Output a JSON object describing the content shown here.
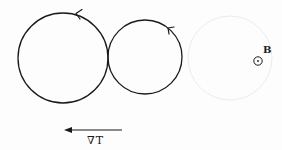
{
  "diagram": {
    "type": "physics-field-diagram",
    "colors": {
      "stroke": "#1a1a1a",
      "ghost": "#eeeeee",
      "background": "#fdfdfd"
    },
    "orbits": [
      {
        "id": "large",
        "cx": 63,
        "cy": 58,
        "r": 45,
        "direction": "counterclockwise"
      },
      {
        "id": "small",
        "cx": 145,
        "cy": 57,
        "r": 37,
        "direction": "counterclockwise"
      }
    ],
    "ghost_circle": {
      "cx": 230,
      "cy": 58,
      "r": 42
    },
    "magnetic_field": {
      "label": "B",
      "symbol": "out-of-page (dot in circle)",
      "x": 258,
      "y": 60
    },
    "gradient_arrow": {
      "label": "∇T",
      "x1": 122,
      "x2": 65,
      "y": 130,
      "direction": "left"
    }
  }
}
